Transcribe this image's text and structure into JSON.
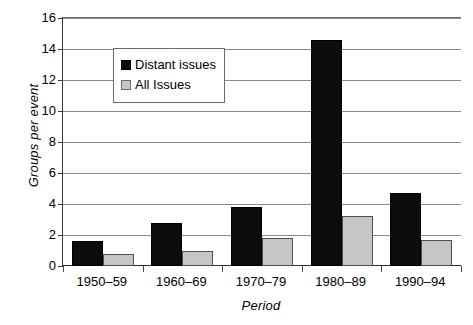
{
  "chart_data": {
    "type": "bar",
    "title": "",
    "xlabel": "Period",
    "ylabel": "Groups per event",
    "categories": [
      "1950–59",
      "1960–69",
      "1970–79",
      "1980–89",
      "1990–94"
    ],
    "series": [
      {
        "name": "Distant issues",
        "color": "#0d0d0d",
        "values": [
          1.6,
          2.8,
          3.8,
          14.6,
          4.7
        ]
      },
      {
        "name": "All Issues",
        "color": "#c6c6c6",
        "values": [
          0.8,
          1.0,
          1.8,
          3.2,
          1.7
        ]
      }
    ],
    "ylim": [
      0,
      16
    ],
    "ytick_step": 2,
    "ytick_labels": [
      "0",
      "2",
      "4",
      "6",
      "8",
      "10",
      "12",
      "14",
      "16"
    ],
    "grid": "horizontal",
    "legend_position": "upper-left-inside"
  },
  "legend": {
    "entries": [
      {
        "label": "Distant issues"
      },
      {
        "label": "All Issues"
      }
    ]
  },
  "axes": {
    "y_title": "Groups per event",
    "x_title": "Period"
  }
}
